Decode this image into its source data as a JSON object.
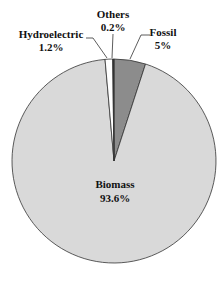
{
  "chart_data": {
    "type": "pie",
    "title": "",
    "categories": [
      "Fossil",
      "Biomass",
      "Hydroelectric",
      "Others"
    ],
    "values": [
      5,
      93.6,
      1.2,
      0.2
    ],
    "value_labels": [
      "5%",
      "93.6%",
      "1.2%",
      "0.2%"
    ],
    "colors": [
      "#8c8c8c",
      "#d9d9d9",
      "#ffffff",
      "#333333"
    ],
    "start_angle_deg": 0,
    "direction": "clockwise",
    "legend": "none",
    "labels_position": "outside with leader lines except Biomass (inside)"
  },
  "labels": {
    "fossil": {
      "name": "Fossil",
      "value": "5%"
    },
    "biomass": {
      "name": "Biomass",
      "value": "93.6%"
    },
    "hydroelectric": {
      "name": "Hydroelectric",
      "value": "1.2%"
    },
    "others": {
      "name": "Others",
      "value": "0.2%"
    }
  }
}
